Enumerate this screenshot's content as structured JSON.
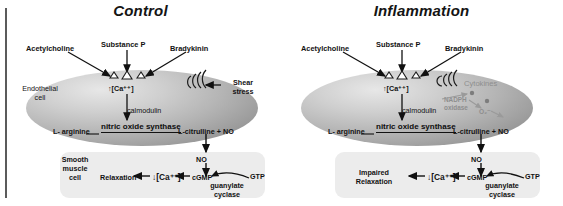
{
  "figure": {
    "type": "biological-pathway-diagram"
  },
  "panels": [
    {
      "id": "control",
      "title": "Control",
      "ligands": [
        {
          "name": "acetylcholine",
          "label": "Acetylcholine"
        },
        {
          "name": "substance-p",
          "label": "Substance P"
        },
        {
          "name": "bradykinin",
          "label": "Bradykinin"
        }
      ],
      "endothelial": {
        "cell_label_line1": "Endothelial",
        "cell_label_line2": "cell",
        "calcium": "↑[Ca⁺⁺]",
        "calmodulin": "calmodulin",
        "substrate": "L- arginine",
        "enzyme": "nitric oxide synthase",
        "product": "L-citrulline + ",
        "product_no": "NO"
      },
      "stimulus": {
        "name": "shear-stress",
        "line1": "Shear",
        "line2": "stress"
      },
      "no_transfer": "NO",
      "smooth_muscle": {
        "cell_label_line1": "Smooth",
        "cell_label_line2": "muscle",
        "cell_label_line3": "cell",
        "outcome": "Relaxation",
        "calcium": "↓[Ca⁺⁺]",
        "cgmp": "cGMP",
        "enzyme_line1": "guanylate",
        "enzyme_line2": "cyclase",
        "gtp": "GTP"
      }
    },
    {
      "id": "inflammation",
      "title": "Inflammation",
      "ligands": [
        {
          "name": "acetylcholine",
          "label": "Acetylcholine"
        },
        {
          "name": "substance-p",
          "label": "Substance P"
        },
        {
          "name": "bradykinin",
          "label": "Bradykinin"
        }
      ],
      "endothelial": {
        "cell_label_line1": "",
        "cell_label_line2": "",
        "calcium": "↑[Ca⁺⁺]",
        "calmodulin": "calmodulin",
        "substrate": "L- arginine",
        "enzyme": "nitric oxide synthase",
        "product": "L-citrulline + ",
        "product_no": "NO"
      },
      "stimulus": {
        "name": "cytokines",
        "line1": "Cytokines",
        "line2": ""
      },
      "oxidative": {
        "enzyme_line1": "NADPH",
        "enzyme_line2": "oxidase",
        "radical": "O₂⁻"
      },
      "no_transfer": "NO",
      "smooth_muscle": {
        "cell_label_line1": "",
        "cell_label_line2": "",
        "cell_label_line3": "",
        "outcome_line1": "Impaired",
        "outcome_line2": "Relaxation",
        "calcium": "↓[Ca⁺⁺]",
        "cgmp": "cGMP",
        "enzyme_line1": "guanylate",
        "enzyme_line2": "cyclase",
        "gtp": "GTP"
      }
    }
  ],
  "colors": {
    "ink": "#121212",
    "faint": "#8e8e8e",
    "smooth_muscle_fill": "#ececec",
    "frame_rule": "#5b5b5b"
  }
}
